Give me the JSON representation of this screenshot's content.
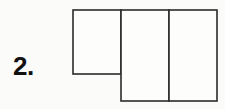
{
  "page": {
    "background_color": "#fbfbfa",
    "width": 225,
    "height": 109
  },
  "problem": {
    "number_label": "2.",
    "kind": "net-of-solid-figure"
  },
  "figure": {
    "name": "three-rectangle-net",
    "stroke_color": "#2b2b2b",
    "fill_color": "#fdfdfc",
    "stroke_width": 1.6,
    "parts": [
      {
        "name": "left-square",
        "x": 73,
        "y": 10,
        "width": 48,
        "height": 64
      },
      {
        "name": "middle-rectangle",
        "x": 121,
        "y": 10,
        "width": 48,
        "height": 91
      },
      {
        "name": "right-rectangle",
        "x": 169,
        "y": 10,
        "width": 48,
        "height": 91
      }
    ]
  }
}
